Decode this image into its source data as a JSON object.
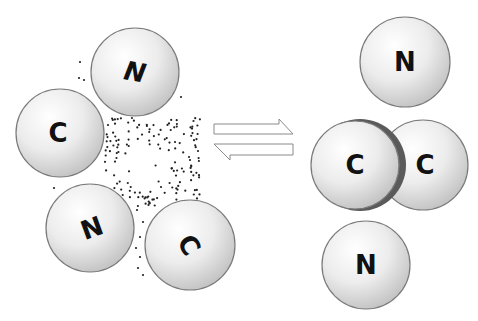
{
  "diagram": {
    "colors": {
      "background": "#ffffff",
      "atom_fill_light": "#fafafa",
      "atom_fill_dark": "#c8c8c8",
      "atom_stroke": "#7a7a7a",
      "bond_shadow": "#555555",
      "label": "#111111",
      "dots": "#222222",
      "arrow_stroke": "#888888"
    },
    "left_state": {
      "atoms": [
        {
          "label": "N",
          "cx": 135,
          "cy": 72,
          "r": 44,
          "rotate": 10
        },
        {
          "label": "C",
          "cx": 60,
          "cy": 133,
          "r": 44,
          "rotate": 0
        },
        {
          "label": "N",
          "cx": 90,
          "cy": 228,
          "r": 44,
          "rotate": -20
        },
        {
          "label": "C",
          "cx": 190,
          "cy": 245,
          "r": 45,
          "rotate": 30
        }
      ],
      "particle_cloud": "dense scatter of small dots between atoms"
    },
    "equilibrium_arrows": {
      "forward": {
        "direction": "right",
        "x1": 214,
        "x2": 294,
        "y": 130
      },
      "reverse": {
        "direction": "left",
        "x1": 214,
        "x2": 294,
        "y": 150
      }
    },
    "right_state": {
      "atoms": [
        {
          "label": "N",
          "cx": 405,
          "cy": 62,
          "r": 45
        },
        {
          "label": "C",
          "cx": 356,
          "cy": 165,
          "r": 44
        },
        {
          "label": "C",
          "cx": 423,
          "cy": 165,
          "r": 45
        },
        {
          "label": "N",
          "cx": 366,
          "cy": 265,
          "r": 44
        }
      ],
      "bond": {
        "between": [
          "C",
          "C"
        ],
        "style": "dark crescent overlap"
      }
    }
  }
}
